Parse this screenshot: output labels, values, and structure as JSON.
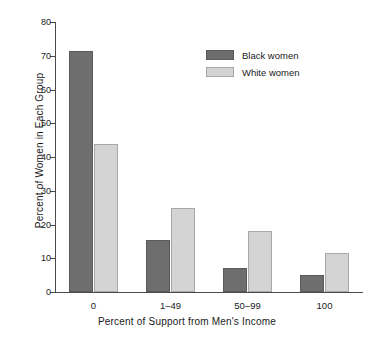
{
  "chart_data": {
    "type": "bar",
    "title": "",
    "subtitle": "",
    "xlabel": "Percent of Support from Men's Income",
    "ylabel": "Percent of Women in Each Group",
    "categories": [
      "0",
      "1–49",
      "50–99",
      "100"
    ],
    "series": [
      {
        "name": "Black women",
        "color": "#6e6e6e",
        "values": [
          71.5,
          15.3,
          7.1,
          5.0
        ]
      },
      {
        "name": "White women",
        "color": "#d4d4d4",
        "values": [
          44.0,
          25.0,
          18.0,
          11.5
        ]
      }
    ],
    "ylim": [
      0,
      80
    ],
    "ytick_labels": [
      "0",
      "10",
      "20",
      "30",
      "40",
      "50",
      "60",
      "70",
      "80"
    ],
    "ytick_values": [
      0,
      10,
      20,
      30,
      40,
      50,
      60,
      70,
      80
    ],
    "grid": false,
    "legend_position": "upper-center-right",
    "bar_border_color": "#8c8c8c",
    "axis_color": "#4a4a4a",
    "background_color": "#ffffff"
  },
  "legend": {
    "entries": [
      {
        "label": "Black women"
      },
      {
        "label": "White women"
      }
    ]
  }
}
